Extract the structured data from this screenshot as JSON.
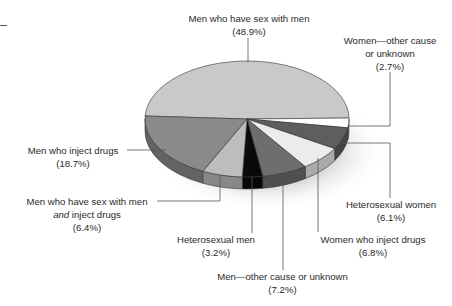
{
  "chart_data": {
    "type": "pie",
    "style": "3d-exploded-tilt",
    "title": "",
    "legend": "none (direct leader-line labels)",
    "slices": [
      {
        "label": "Men who have sex with men",
        "value": 48.9,
        "value_label": "(48.9%)",
        "color": "#c9c9c9"
      },
      {
        "label": "Women—other cause or unknown",
        "value": 2.7,
        "value_label": "(2.7%)",
        "color": "#ffffff"
      },
      {
        "label": "Heterosexual women",
        "value": 6.1,
        "value_label": "(6.1%)",
        "color": "#5e5e5e"
      },
      {
        "label": "Women who inject drugs",
        "value": 6.8,
        "value_label": "(6.8%)",
        "color": "#ececec"
      },
      {
        "label": "Men—other cause or unknown",
        "value": 7.2,
        "value_label": "(7.2%)",
        "color": "#6e6e6e"
      },
      {
        "label": "Heterosexual men",
        "value": 3.2,
        "value_label": "(3.2%)",
        "color": "#0a0a0a"
      },
      {
        "label": "Men who have sex with men and inject drugs",
        "value": 6.4,
        "value_label": "(6.4%)",
        "color": "#bdbdbd"
      },
      {
        "label": "Men who inject drugs",
        "value": 18.7,
        "value_label": "(18.7%)",
        "color": "#8a8a8a"
      }
    ]
  },
  "labels": {
    "msm": {
      "line1": "Men who have sex with men",
      "line2": "(48.9%)"
    },
    "women_other": {
      "line1": "Women—other cause",
      "line2": "or unknown",
      "line3": "(2.7%)"
    },
    "midu": {
      "line1": "Men who inject drugs",
      "line2": "(18.7%)"
    },
    "msm_idu": {
      "line1": "Men who have sex with men",
      "line2_em": "and",
      "line2_rest": " inject drugs",
      "line3": "(6.4%)"
    },
    "hetero_women": {
      "line1": "Heterosexual women",
      "line2": "(6.1%)"
    },
    "hetero_men": {
      "line1": "Heterosexual men",
      "line2": "(3.2%)"
    },
    "widu": {
      "line1": "Women who inject drugs",
      "line2": "(6.8%)"
    },
    "men_other": {
      "line1": "Men—other cause or unknown",
      "line2": "(7.2%)"
    }
  }
}
